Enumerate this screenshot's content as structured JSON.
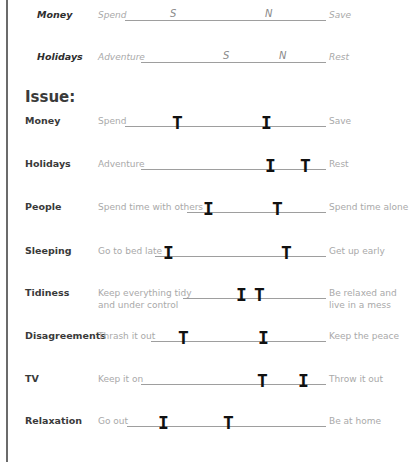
{
  "examples": [
    {
      "category": "Money",
      "left": "Spend",
      "right": "Save",
      "line": {
        "x1": 125,
        "x2": 326,
        "y": 20
      },
      "marks": [
        {
          "letter": "S",
          "x": 173
        },
        {
          "letter": "N",
          "x": 268
        }
      ]
    },
    {
      "category": "Holidays",
      "left": "Adventure",
      "right": "Rest",
      "line": {
        "x1": 141,
        "x2": 326,
        "y": 62
      },
      "marks": [
        {
          "letter": "S",
          "x": 226
        },
        {
          "letter": "N",
          "x": 282
        }
      ]
    }
  ],
  "issue_heading": "Issue:",
  "issues": [
    {
      "category": "Money",
      "left": "Spend",
      "right": "Save",
      "line": {
        "x1": 125,
        "x2": 326,
        "y": 126
      },
      "marks": [
        {
          "glyph": "T",
          "x": 177
        },
        {
          "glyph": "I",
          "x": 266
        }
      ]
    },
    {
      "category": "Holidays",
      "left": "Adventure",
      "right": "Rest",
      "line": {
        "x1": 141,
        "x2": 326,
        "y": 169
      },
      "marks": [
        {
          "glyph": "I",
          "x": 270
        },
        {
          "glyph": "T",
          "x": 305
        }
      ]
    },
    {
      "category": "People",
      "left": "Spend time with others",
      "right": "Spend time alone",
      "line": {
        "x1": 187,
        "x2": 326,
        "y": 212
      },
      "marks": [
        {
          "glyph": "I",
          "x": 208
        },
        {
          "glyph": "T",
          "x": 277
        }
      ]
    },
    {
      "category": "Sleeping",
      "left": "Go to bed late",
      "right": "Get up early",
      "line": {
        "x1": 155,
        "x2": 326,
        "y": 256
      },
      "marks": [
        {
          "glyph": "I",
          "x": 168
        },
        {
          "glyph": "T",
          "x": 286
        }
      ]
    },
    {
      "category": "Tidiness",
      "left": "Keep everything tidy\nand under control",
      "right": "Be relaxed and\nlive in a mess",
      "line": {
        "x1": 183,
        "x2": 326,
        "y": 298
      },
      "marks": [
        {
          "glyph": "I",
          "x": 241
        },
        {
          "glyph": "T",
          "x": 259
        }
      ]
    },
    {
      "category": "Disagreements",
      "left": "Thrash it out",
      "right": "Keep the peace",
      "line": {
        "x1": 151,
        "x2": 326,
        "y": 341
      },
      "marks": [
        {
          "glyph": "T",
          "x": 183
        },
        {
          "glyph": "I",
          "x": 263
        }
      ]
    },
    {
      "category": "TV",
      "left": "Keep it on",
      "right": "Throw it out",
      "line": {
        "x1": 141,
        "x2": 326,
        "y": 384
      },
      "marks": [
        {
          "glyph": "T",
          "x": 262
        },
        {
          "glyph": "I",
          "x": 303
        }
      ]
    },
    {
      "category": "Relaxation",
      "left": "Go out",
      "right": "Be at home",
      "line": {
        "x1": 127,
        "x2": 326,
        "y": 426
      },
      "marks": [
        {
          "glyph": "I",
          "x": 163
        },
        {
          "glyph": "T",
          "x": 228
        }
      ]
    }
  ]
}
